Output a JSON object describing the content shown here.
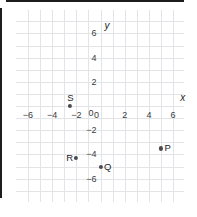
{
  "chart_data": {
    "type": "scatter",
    "title": "",
    "xlabel": "x",
    "ylabel": "y",
    "xlim": [
      -7,
      7
    ],
    "ylim": [
      -7,
      7
    ],
    "grid": true,
    "legend": "none",
    "x_ticks": [
      {
        "value": -6,
        "label": "−6"
      },
      {
        "value": -4,
        "label": "−4"
      },
      {
        "value": -2,
        "label": "−2"
      },
      {
        "value": 0,
        "label": "0"
      },
      {
        "value": 2,
        "label": "2"
      },
      {
        "value": 4,
        "label": "4"
      },
      {
        "value": 6,
        "label": "6"
      }
    ],
    "y_ticks": [
      {
        "value": 6,
        "label": "6"
      },
      {
        "value": 4,
        "label": "4"
      },
      {
        "value": 2,
        "label": "2"
      },
      {
        "value": 0,
        "label": "0"
      },
      {
        "value": -2,
        "label": "−2"
      },
      {
        "value": -4,
        "label": "−4"
      },
      {
        "value": -6,
        "label": "−6"
      }
    ],
    "points": [
      {
        "name": "P",
        "x": 5,
        "y": -3.5,
        "label": "P",
        "label_position": "right"
      },
      {
        "name": "Q",
        "x": 0,
        "y": -5,
        "label": "Q",
        "label_position": "right"
      },
      {
        "name": "R",
        "x": -2,
        "y": -4.3,
        "label": "R",
        "label_position": "left"
      },
      {
        "name": "S",
        "x": -2.5,
        "y": 0,
        "label": "S",
        "label_position": "above"
      }
    ],
    "colors": {
      "grid": "#e2e4e8",
      "axis": "#1d1d1f",
      "point": "#4a4a4f",
      "text": "#1d1d1f",
      "background": "#ffffff"
    }
  }
}
